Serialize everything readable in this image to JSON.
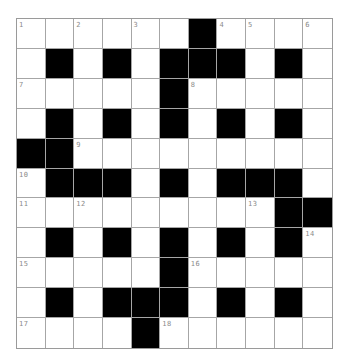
{
  "puzzle": {
    "rows": 11,
    "cols": 11,
    "colors": {
      "black_cell": "#000000",
      "white_cell": "#ffffff",
      "grid_line": "#a6a6a6",
      "number_text": "#8a8a8a"
    },
    "grid": [
      [
        "1",
        ".",
        "2",
        ".",
        "3",
        ".",
        "#",
        "4",
        "5",
        ".",
        "6"
      ],
      [
        ".",
        "#",
        ".",
        "#",
        ".",
        "#",
        "#",
        "#",
        ".",
        "#",
        "."
      ],
      [
        "7",
        ".",
        ".",
        ".",
        ".",
        "#",
        "8",
        ".",
        ".",
        ".",
        "."
      ],
      [
        ".",
        "#",
        ".",
        "#",
        ".",
        "#",
        ".",
        "#",
        ".",
        "#",
        "."
      ],
      [
        "#",
        "#",
        "9",
        ".",
        ".",
        ".",
        ".",
        ".",
        ".",
        ".",
        "."
      ],
      [
        "10",
        "#",
        "#",
        "#",
        ".",
        "#",
        ".",
        "#",
        "#",
        "#",
        "."
      ],
      [
        "11",
        ".",
        "12",
        ".",
        ".",
        ".",
        ".",
        ".",
        "13",
        "#",
        "#"
      ],
      [
        ".",
        "#",
        ".",
        "#",
        ".",
        "#",
        ".",
        "#",
        ".",
        "#",
        "14"
      ],
      [
        "15",
        ".",
        ".",
        ".",
        ".",
        "#",
        "16",
        ".",
        ".",
        ".",
        "."
      ],
      [
        ".",
        "#",
        ".",
        "#",
        "#",
        "#",
        ".",
        "#",
        ".",
        "#",
        "."
      ],
      [
        "17",
        ".",
        ".",
        ".",
        "#",
        "18",
        ".",
        ".",
        ".",
        ".",
        "."
      ]
    ],
    "clue_numbers": [
      "1",
      "2",
      "3",
      "4",
      "5",
      "6",
      "7",
      "8",
      "9",
      "10",
      "11",
      "12",
      "13",
      "14",
      "15",
      "16",
      "17",
      "18"
    ]
  }
}
